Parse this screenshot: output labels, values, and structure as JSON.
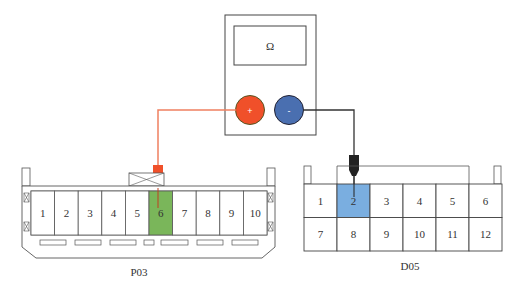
{
  "meter": {
    "display_symbol": "Ω",
    "plus_symbol": "+",
    "minus_symbol": "-",
    "plus_color": "#f0502a",
    "minus_color": "#4a6fb0"
  },
  "wires": {
    "positive_color": "#f08060",
    "negative_color": "#333333"
  },
  "connector_p03": {
    "label": "P03",
    "pins": [
      "1",
      "2",
      "3",
      "4",
      "5",
      "6",
      "7",
      "8",
      "9",
      "10"
    ],
    "highlighted_pin": "6",
    "highlight_color": "#7ab65a"
  },
  "connector_d05": {
    "label": "D05",
    "rows": [
      [
        "1",
        "2",
        "3",
        "4",
        "5",
        "6"
      ],
      [
        "7",
        "8",
        "9",
        "10",
        "11",
        "12"
      ]
    ],
    "highlighted_pin": "2",
    "highlight_color": "#7aaee0"
  }
}
